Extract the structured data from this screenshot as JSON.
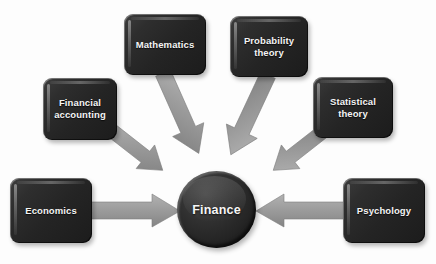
{
  "diagram": {
    "background_color": "#fdfdfd",
    "hub": {
      "label": "Finance",
      "shape": "circle",
      "color": "#242424",
      "text_color": "#f6f6f6",
      "center_x": 216,
      "center_y": 210
    },
    "arrow_color": "#9a9a9a",
    "node_color": "#2a2a2a",
    "node_text_color": "#f4f4f4",
    "nodes": [
      {
        "id": "financial-accounting",
        "label": "Financial\naccounting",
        "x": 43,
        "y": 78,
        "width": 74,
        "height": 62,
        "arrow_direction": "down-right",
        "points_to": "Finance"
      },
      {
        "id": "mathematics",
        "label": "Mathematics",
        "x": 124,
        "y": 14,
        "width": 82,
        "height": 61,
        "arrow_direction": "down-right",
        "points_to": "Finance"
      },
      {
        "id": "probability-theory",
        "label": "Probability\ntheory",
        "x": 230,
        "y": 16,
        "width": 78,
        "height": 61,
        "arrow_direction": "down-left",
        "points_to": "Finance"
      },
      {
        "id": "statistical-theory",
        "label": "Statistical\ntheory",
        "x": 313,
        "y": 77,
        "width": 80,
        "height": 61,
        "arrow_direction": "down-left",
        "points_to": "Finance"
      },
      {
        "id": "economics",
        "label": "Economics",
        "x": 10,
        "y": 178,
        "width": 82,
        "height": 65,
        "arrow_direction": "right",
        "points_to": "Finance"
      },
      {
        "id": "psychology",
        "label": "Psychology",
        "x": 343,
        "y": 178,
        "width": 82,
        "height": 65,
        "arrow_direction": "left",
        "points_to": "Finance"
      }
    ]
  }
}
